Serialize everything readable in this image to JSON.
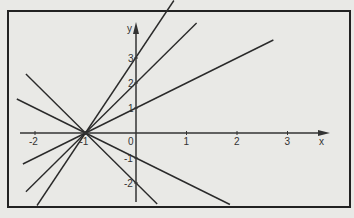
{
  "chart_data": {
    "type": "line",
    "title": "",
    "xlabel": "x",
    "ylabel": "y",
    "xlim": [
      -2.5,
      4.2
    ],
    "ylim": [
      -2.9,
      4.9
    ],
    "x_ticks": [
      "-2",
      "-1",
      "0",
      "1",
      "2",
      "3"
    ],
    "y_ticks": [
      "3",
      "2",
      "1",
      "-1",
      "-2"
    ],
    "origin_label": "0",
    "grid": false,
    "common_point": [
      -1,
      0
    ],
    "series": [
      {
        "name": "y = 3(x+1)",
        "slope": 3,
        "intercept": 3,
        "x": [
          -1.96,
          0.75
        ],
        "y": [
          -2.9,
          5.3
        ]
      },
      {
        "name": "y = 2(x+1)",
        "slope": 2,
        "intercept": 2,
        "x": [
          -2.18,
          1.2
        ],
        "y": [
          -2.35,
          4.4
        ]
      },
      {
        "name": "y = x+1",
        "slope": 1,
        "intercept": 1,
        "x": [
          -2.24,
          2.72
        ],
        "y": [
          -1.24,
          3.72
        ]
      },
      {
        "name": "y = -(x+1)",
        "slope": -1,
        "intercept": -1,
        "x": [
          -2.36,
          1.86
        ],
        "y": [
          1.36,
          -2.86
        ]
      },
      {
        "name": "y = -2(x+1)",
        "slope": -2,
        "intercept": -2,
        "x": [
          -2.18,
          0.42
        ],
        "y": [
          2.36,
          -2.84
        ]
      }
    ]
  },
  "axes": {
    "x_label": "x",
    "y_label": "y"
  }
}
